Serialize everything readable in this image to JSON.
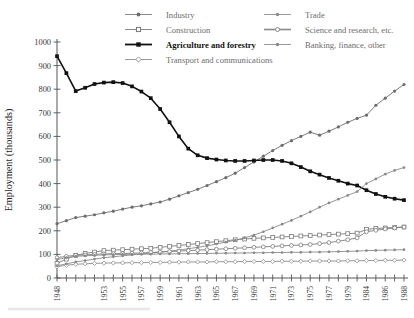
{
  "chart_data": {
    "type": "line",
    "title": "",
    "xlabel": "",
    "ylabel": "Employment  (thousands)",
    "ylim": [
      0,
      1000
    ],
    "yticks": [
      0,
      100,
      200,
      300,
      400,
      500,
      600,
      700,
      800,
      900,
      1000
    ],
    "grid": false,
    "legend_position": "top",
    "x": [
      1948,
      1949,
      1950,
      1951,
      1952,
      1953,
      1954,
      1955,
      1956,
      1957,
      1958,
      1959,
      1960,
      1961,
      1962,
      1963,
      1964,
      1965,
      1966,
      1967,
      1968,
      1969,
      1970,
      1971,
      1972,
      1973,
      1974,
      1975,
      1976,
      1977,
      1978,
      1979,
      1980,
      1984,
      1985,
      1986,
      1987,
      1988
    ],
    "xtick_labels": [
      "1948",
      "",
      "",
      "",
      "",
      "1953",
      "",
      "1955",
      "",
      "1957",
      "",
      "1959",
      "",
      "1961",
      "",
      "1963",
      "",
      "1965",
      "",
      "1967",
      "",
      "1969",
      "",
      "1971",
      "",
      "1973",
      "",
      "1975",
      "",
      "1977",
      "",
      "1979",
      "",
      "1984",
      "",
      "1986",
      "",
      "1988"
    ],
    "series": [
      {
        "name": "Industry",
        "marker": "filled-circle",
        "color": "#6d6d6d",
        "values": [
          230,
          243,
          256,
          262,
          268,
          276,
          283,
          292,
          300,
          306,
          314,
          322,
          334,
          348,
          362,
          376,
          392,
          408,
          425,
          444,
          468,
          492,
          516,
          540,
          562,
          582,
          600,
          618,
          605,
          622,
          640,
          660,
          676,
          690,
          732,
          762,
          792,
          820
        ]
      },
      {
        "name": "Construction",
        "marker": "open-square",
        "color": "#7a7a7a",
        "values": [
          62,
          80,
          96,
          104,
          110,
          116,
          118,
          120,
          122,
          124,
          126,
          130,
          134,
          138,
          142,
          146,
          150,
          154,
          158,
          162,
          165,
          168,
          170,
          172,
          174,
          176,
          178,
          180,
          182,
          184,
          186,
          188,
          190,
          206,
          210,
          212,
          214,
          216
        ]
      },
      {
        "name": "Agriculture and forestry",
        "marker": "filled-square",
        "color": "#111111",
        "values": [
          940,
          868,
          792,
          806,
          822,
          828,
          830,
          826,
          812,
          790,
          762,
          716,
          660,
          600,
          548,
          520,
          508,
          502,
          498,
          496,
          496,
          498,
          500,
          500,
          496,
          486,
          470,
          452,
          438,
          424,
          412,
          400,
          392,
          372,
          356,
          344,
          336,
          330
        ]
      },
      {
        "name": "Transport and communications",
        "marker": "open-diamond",
        "color": "#8d8d8d",
        "values": [
          48,
          54,
          58,
          60,
          62,
          63,
          64,
          64,
          65,
          65,
          66,
          66,
          67,
          67,
          68,
          68,
          68,
          69,
          69,
          69,
          70,
          70,
          70,
          70,
          71,
          71,
          71,
          72,
          72,
          72,
          72,
          73,
          73,
          74,
          74,
          75,
          75,
          76
        ]
      },
      {
        "name": "Trade",
        "marker": "filled-circle-small",
        "color": "#8a8a8a",
        "values": [
          52,
          60,
          68,
          74,
          80,
          86,
          90,
          94,
          98,
          102,
          106,
          110,
          114,
          118,
          124,
          130,
          136,
          144,
          152,
          160,
          170,
          182,
          196,
          212,
          228,
          244,
          262,
          280,
          300,
          318,
          334,
          350,
          366,
          400,
          420,
          440,
          456,
          468
        ]
      },
      {
        "name": "Science and research, etc.",
        "marker": "open-circle",
        "color": "#7e7e7e",
        "values": [
          86,
          92,
          96,
          98,
          100,
          102,
          103,
          104,
          105,
          106,
          108,
          110,
          112,
          114,
          116,
          118,
          120,
          122,
          124,
          126,
          128,
          130,
          132,
          134,
          136,
          138,
          140,
          142,
          146,
          150,
          156,
          162,
          170,
          196,
          202,
          208,
          212,
          216
        ]
      },
      {
        "name": "Banking, finance, other",
        "marker": "filled-circle-small",
        "color": "#8a8a8a",
        "values": [
          78,
          86,
          92,
          94,
          96,
          98,
          99,
          100,
          100,
          101,
          101,
          102,
          102,
          103,
          103,
          104,
          104,
          105,
          105,
          106,
          106,
          107,
          107,
          108,
          108,
          109,
          109,
          110,
          110,
          111,
          112,
          113,
          114,
          116,
          117,
          118,
          119,
          120
        ]
      }
    ]
  },
  "legend": {
    "left_column": [
      {
        "label": "Industry"
      },
      {
        "label": "Construction"
      },
      {
        "label": "Agriculture and forestry"
      },
      {
        "label": "Transport and communications"
      }
    ],
    "right_column": [
      {
        "label": "Trade"
      },
      {
        "label": "Science and research, etc."
      },
      {
        "label": "Banking, finance, other"
      }
    ]
  },
  "axis": {
    "y_title": "Employment  (thousands)"
  }
}
